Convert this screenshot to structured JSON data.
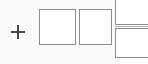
{
  "canvas": {
    "width_px": 148,
    "height_px": 64,
    "background_color": "#fbfbfb",
    "stroke_color": "#8d8d8d",
    "glyph_color": "#4a4a4a",
    "fill_color": "#ffffff"
  },
  "add_control": {
    "icon": "plus-icon",
    "label": "+",
    "tooltip": "Add"
  },
  "tiles": [
    {
      "name": "placeholder-tile-1",
      "label": "",
      "state": "empty"
    },
    {
      "name": "placeholder-tile-2",
      "label": "",
      "state": "empty"
    }
  ],
  "clipped_panels": [
    {
      "name": "panel-top",
      "label": "",
      "state": "clipped"
    },
    {
      "name": "panel-bottom",
      "label": "",
      "state": "clipped"
    }
  ]
}
